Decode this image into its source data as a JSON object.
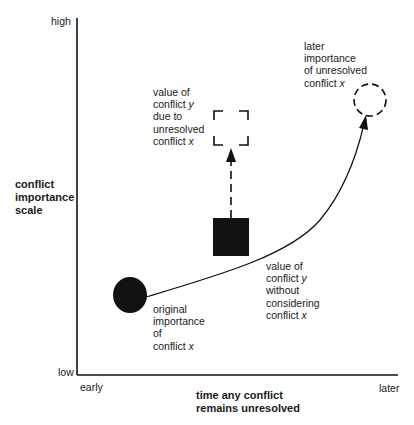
{
  "diagram": {
    "axes": {
      "y_label": [
        "conflict",
        "importance",
        "scale"
      ],
      "y_high": "high",
      "y_low": "low",
      "x_label": [
        "time any conflict",
        "remains unresolved"
      ],
      "x_early": "early",
      "x_later": "later"
    },
    "annotations": {
      "original": [
        "original",
        "importance",
        "of",
        "conflict x"
      ],
      "later_importance": [
        "later",
        "importance",
        "of unresolved",
        "conflict x"
      ],
      "value_due_to": [
        "value of",
        "conflict y",
        "due to",
        "unresolved",
        "conflict x"
      ],
      "value_without": [
        "value of",
        "conflict y",
        "without",
        "considering",
        "conflict x"
      ]
    },
    "shapes": {
      "original_circle": {
        "type": "filled-circle",
        "meaning": "original importance of conflict x"
      },
      "later_circle": {
        "type": "dashed-circle",
        "meaning": "later importance of unresolved conflict x"
      },
      "square_without": {
        "type": "filled-square",
        "meaning": "value of conflict y without considering conflict x"
      },
      "square_due_to": {
        "type": "dashed-square",
        "meaning": "value of conflict y due to unresolved conflict x"
      }
    },
    "colors": {
      "ink": "#111111",
      "background": "#ffffff"
    }
  }
}
